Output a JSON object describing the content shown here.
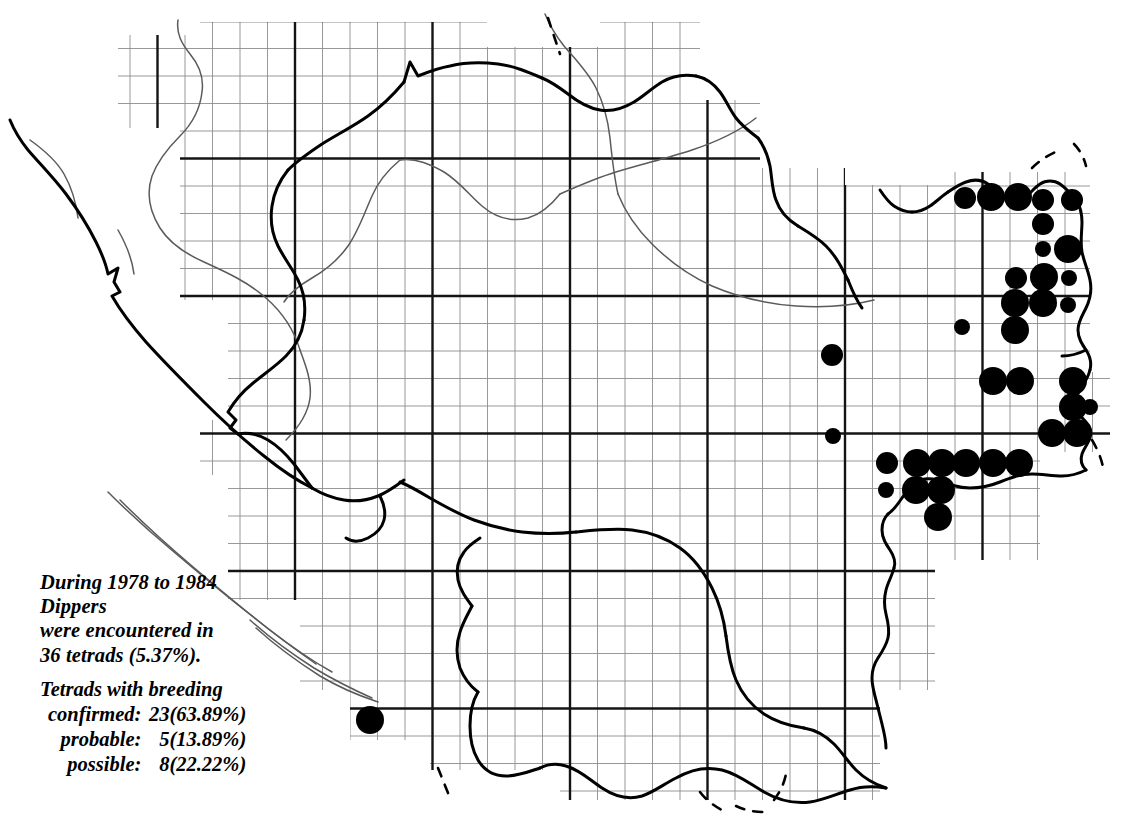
{
  "legend": {
    "survey_line_1": "During 1978 to 1984",
    "species": "Dippers",
    "survey_line_3": "were encountered in",
    "survey_line_4": "36 tetrads (5.37%).",
    "breeding_heading": "Tetrads with breeding",
    "rows": [
      {
        "label": "confirmed:",
        "count": "23",
        "percent": "(63.89%)"
      },
      {
        "label": "probable:",
        "count": "5",
        "percent": "(13.89%)"
      },
      {
        "label": "possible:",
        "count": "8",
        "percent": "(22.22%)"
      }
    ]
  },
  "summary": {
    "start_year": 1978,
    "end_year": 1984,
    "species_name": "Dippers",
    "total_tetrads": 36,
    "total_percent": 5.37,
    "confirmed": 23,
    "confirmed_percent": 63.89,
    "probable": 5,
    "probable_percent": 13.89,
    "possible": 8,
    "possible_percent": 22.22
  },
  "chart_data": {
    "type": "scatter",
    "xlabel": "",
    "ylabel": "",
    "grid": true,
    "legend_position": "bottom-left",
    "symbol_scale": {
      "large": {
        "meaning": "confirmed breeding",
        "radius_px": 14
      },
      "medium": {
        "meaning": "probable breeding",
        "radius_px": 11
      },
      "small": {
        "meaning": "possible breeding",
        "radius_px": 8
      }
    },
    "categories": [
      "confirmed",
      "probable",
      "possible"
    ],
    "values": [
      23,
      5,
      8
    ],
    "colors": {
      "symbol": "#000000",
      "grid_thin": "#8a8a8a",
      "grid_thick": "#1a1a1a",
      "boundary": "#000000",
      "river": "#555555",
      "background": "#ffffff"
    },
    "points": [
      {
        "x": 965,
        "y": 198,
        "size": "medium"
      },
      {
        "x": 991,
        "y": 197,
        "size": "large"
      },
      {
        "x": 1018,
        "y": 197,
        "size": "large"
      },
      {
        "x": 1043,
        "y": 200,
        "size": "medium"
      },
      {
        "x": 1072,
        "y": 200,
        "size": "medium"
      },
      {
        "x": 1043,
        "y": 224,
        "size": "medium"
      },
      {
        "x": 1068,
        "y": 249,
        "size": "large"
      },
      {
        "x": 1016,
        "y": 278,
        "size": "medium"
      },
      {
        "x": 1044,
        "y": 277,
        "size": "large"
      },
      {
        "x": 1069,
        "y": 278,
        "size": "small"
      },
      {
        "x": 1015,
        "y": 303,
        "size": "large"
      },
      {
        "x": 1043,
        "y": 303,
        "size": "large"
      },
      {
        "x": 1068,
        "y": 305,
        "size": "small"
      },
      {
        "x": 962,
        "y": 327,
        "size": "small"
      },
      {
        "x": 1015,
        "y": 330,
        "size": "large"
      },
      {
        "x": 832,
        "y": 355,
        "size": "medium"
      },
      {
        "x": 993,
        "y": 381,
        "size": "large"
      },
      {
        "x": 1020,
        "y": 381,
        "size": "large"
      },
      {
        "x": 1073,
        "y": 381,
        "size": "large"
      },
      {
        "x": 1073,
        "y": 407,
        "size": "large"
      },
      {
        "x": 1052,
        "y": 433,
        "size": "large"
      },
      {
        "x": 1077,
        "y": 433,
        "size": "large"
      },
      {
        "x": 833,
        "y": 436,
        "size": "small"
      },
      {
        "x": 887,
        "y": 463,
        "size": "medium"
      },
      {
        "x": 917,
        "y": 463,
        "size": "large"
      },
      {
        "x": 942,
        "y": 463,
        "size": "large"
      },
      {
        "x": 966,
        "y": 463,
        "size": "large"
      },
      {
        "x": 993,
        "y": 463,
        "size": "large"
      },
      {
        "x": 1019,
        "y": 463,
        "size": "large"
      },
      {
        "x": 886,
        "y": 490,
        "size": "small"
      },
      {
        "x": 916,
        "y": 490,
        "size": "large"
      },
      {
        "x": 941,
        "y": 490,
        "size": "large"
      },
      {
        "x": 938,
        "y": 517,
        "size": "large"
      },
      {
        "x": 370,
        "y": 720,
        "size": "large"
      },
      {
        "x": 1043,
        "y": 249,
        "size": "small"
      },
      {
        "x": 1090,
        "y": 407,
        "size": "small"
      }
    ]
  }
}
